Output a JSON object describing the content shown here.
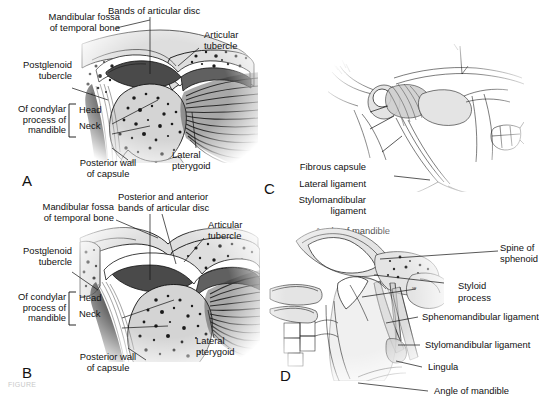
{
  "figure": {
    "caption_partial": "FIGURE",
    "panels": [
      "A",
      "B",
      "C",
      "D"
    ]
  },
  "panelA": {
    "letter": "A",
    "labels": {
      "mandibular_fossa": "Mandibular fossa\nof temporal bone",
      "bands_of_disc": "Bands of articular disc",
      "articular_tubercle": "Articular\ntubercle",
      "postglenoid_tubercle": "Postglenoid\ntubercle",
      "of_condylar": "Of condylar\nprocess of\nmandible",
      "head": "Head",
      "neck": "Neck",
      "posterior_wall": "Posterior wall\nof capsule",
      "lateral_pterygoid": "Lateral\npterygoid"
    }
  },
  "panelB": {
    "letter": "B",
    "labels": {
      "mandibular_fossa": "Mandibular fossa\nof temporal bone",
      "bands_of_disc": "Posterior and anterior\nbands of articular disc",
      "articular_tubercle": "Articular\ntubercle",
      "postglenoid_tubercle": "Postglenoid\ntubercle",
      "of_condylar": "Of condylar\nprocess of\nmandible",
      "head": "Head",
      "neck": "Neck",
      "posterior_wall": "Posterior wall\nof capsule",
      "lateral_pterygoid": "Lateral\npterygoid"
    }
  },
  "panelC": {
    "letter": "C",
    "labels": {
      "fibrous_capsule": "Fibrous capsule",
      "lateral_ligament": "Lateral ligament",
      "stylomandibular_ligament": "Stylomandibular\nligament",
      "angle_of_mandible": "Angle of mandible"
    }
  },
  "panelD": {
    "letter": "D",
    "labels": {
      "spine_of_sphenoid": "Spine of\nsphenoid",
      "styloid_process_line1": "Styloid",
      "styloid_process_line2": "process",
      "sphenomandibular_ligament": "Sphenomandibular ligament",
      "stylomandibular_ligament": "Stylomandibular ligament",
      "lingula": "Lingula",
      "angle_of_mandible": "Angle of mandible"
    }
  }
}
